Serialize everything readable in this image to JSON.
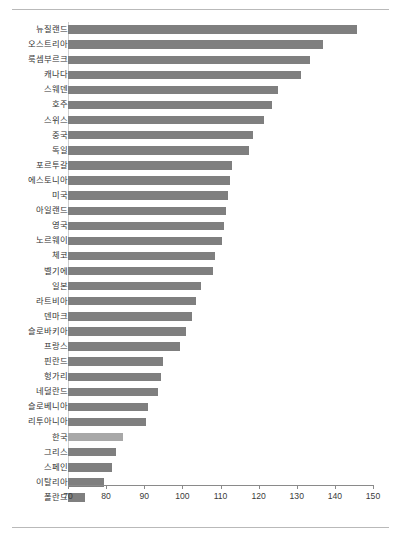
{
  "chart_data": {
    "type": "bar",
    "orientation": "horizontal",
    "title": "",
    "subtitle": "",
    "xlabel": "",
    "ylabel": "",
    "xlim": [
      70,
      150
    ],
    "xticks": [
      70,
      80,
      90,
      100,
      110,
      120,
      130,
      140,
      150
    ],
    "xtick_labels": [
      "70",
      "80",
      "90",
      "100",
      "110",
      "120",
      "130",
      "140",
      "150"
    ],
    "grid": false,
    "legend": "none",
    "bar_color": "#7f7f7f",
    "highlight_color": "#a8a8a8",
    "highlight_category": "한국",
    "categories": [
      "뉴질랜드",
      "오스트리아",
      "룩셈부르크",
      "캐나다",
      "스웨덴",
      "호주",
      "스위스",
      "중국",
      "독일",
      "포르투갈",
      "에스토니아",
      "미국",
      "아일랜드",
      "영국",
      "노르웨이",
      "체코",
      "벨기에",
      "일본",
      "라트비아",
      "덴마크",
      "슬로바키아",
      "프랑스",
      "핀란드",
      "헝가리",
      "네덜란드",
      "슬로베니아",
      "리투아니아",
      "한국",
      "그리스",
      "스페인",
      "이탈리아",
      "폴란드"
    ],
    "values": [
      145.8,
      137.0,
      133.5,
      131.0,
      125.0,
      123.5,
      121.5,
      118.5,
      117.5,
      113.0,
      112.5,
      112.0,
      111.5,
      111.0,
      110.5,
      108.5,
      108.0,
      105.0,
      103.5,
      102.5,
      101.0,
      99.5,
      95.0,
      94.5,
      93.5,
      91.0,
      90.5,
      84.5,
      82.5,
      81.5,
      79.5,
      74.5
    ]
  }
}
